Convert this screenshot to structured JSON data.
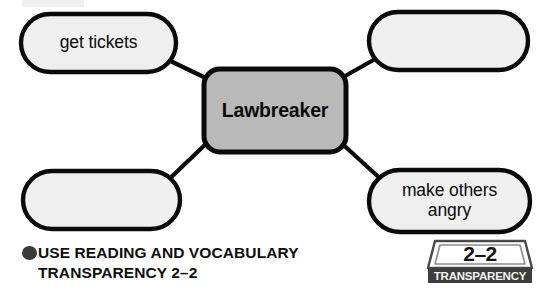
{
  "diagram": {
    "type": "word-web",
    "center": {
      "label": "Lawbreaker",
      "shape": "rounded-rectangle",
      "fill": "#b9b9b9",
      "stroke": "#000000"
    },
    "nodes": [
      {
        "id": "top-left",
        "label": "get tickets",
        "filled_in": true,
        "shape": "oval",
        "fill": "#efefef"
      },
      {
        "id": "top-right",
        "label": "",
        "filled_in": false,
        "shape": "oval",
        "fill": "#efefef"
      },
      {
        "id": "bottom-left",
        "label": "",
        "filled_in": false,
        "shape": "oval",
        "fill": "#efefef"
      },
      {
        "id": "bottom-right",
        "label": "make others\nangry",
        "filled_in": true,
        "shape": "oval",
        "fill": "#efefef"
      }
    ],
    "connectors": 4
  },
  "caption": {
    "bullet": "filled-circle-bullet",
    "text": "USE READING AND VOCABULARY\nTRANSPARENCY 2–2"
  },
  "badge": {
    "number": "2–2",
    "word": "TRANSPARENCY",
    "plate_fill": "#ffffff",
    "bar_fill": "#3d3d3d"
  }
}
